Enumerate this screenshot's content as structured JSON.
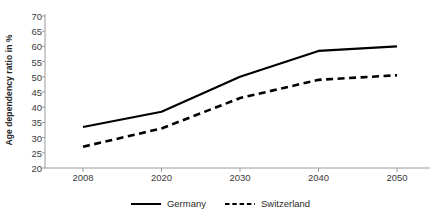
{
  "chart_data": {
    "type": "line",
    "title": "",
    "xlabel": "",
    "ylabel": "Age dependency ratio in %",
    "categories": [
      "2008",
      "2020",
      "2030",
      "2040",
      "2050"
    ],
    "x": [
      2008,
      2020,
      2030,
      2040,
      2050
    ],
    "xlim": [
      2008,
      2050
    ],
    "ylim": [
      20,
      70
    ],
    "yticks": [
      20,
      25,
      30,
      35,
      40,
      45,
      50,
      55,
      60,
      65,
      70
    ],
    "grid": false,
    "legend_position": "bottom",
    "series": [
      {
        "name": "Germany",
        "values": [
          33.5,
          38.5,
          50.0,
          58.5,
          60.0
        ],
        "style": "solid",
        "color": "#000000"
      },
      {
        "name": "Switzerland",
        "values": [
          27.0,
          33.0,
          43.0,
          49.0,
          50.5
        ],
        "style": "dashed",
        "color": "#000000"
      }
    ]
  },
  "axes": {
    "y_title": "Age dependency ratio in %",
    "y_tick_labels": [
      "70",
      "65",
      "60",
      "55",
      "50",
      "45",
      "40",
      "35",
      "30",
      "25",
      "20"
    ],
    "x_tick_labels": [
      "2008",
      "2020",
      "2030",
      "2040",
      "2050"
    ]
  },
  "legend": {
    "entries": [
      {
        "label": "Germany",
        "style": "solid"
      },
      {
        "label": "Switzerland",
        "style": "dashed"
      }
    ]
  }
}
